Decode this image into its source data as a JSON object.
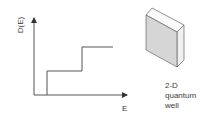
{
  "diagram": {
    "plot": {
      "y_axis_label": "D(E)",
      "x_axis_label": "E",
      "curve": "staircase density of states",
      "steps": [
        {
          "from_x": 47,
          "level": "first"
        },
        {
          "from_x": 82,
          "level": "second"
        }
      ]
    },
    "illustration": {
      "shape": "slab",
      "caption_lines": [
        "2-D",
        "quantum",
        "well"
      ]
    },
    "colors": {
      "line": "#555555",
      "slab_front": "#d6d6d6",
      "slab_side": "#f0f0f0",
      "slab_top": "#fafafa",
      "text": "#3a3a3a"
    }
  }
}
